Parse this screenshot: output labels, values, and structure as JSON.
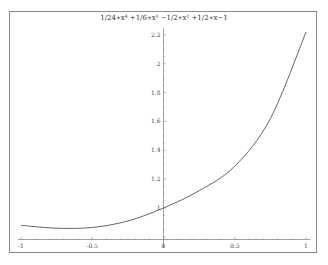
{
  "chart_data": {
    "type": "line",
    "title": "1/24∗x⁴ +1/6∗x³ −1/2∗x² +1/2∗x−1",
    "xlabel": "",
    "ylabel": "",
    "xlim": [
      -1,
      1
    ],
    "ylim": [
      0.78,
      2.25
    ],
    "grid": false,
    "legend": null,
    "x_ticks": [
      "-1",
      "-0.5",
      "0",
      "0.5",
      "1"
    ],
    "y_ticks": [
      "1",
      "1.2",
      "1.4",
      "1.6",
      "1.8",
      "2",
      "2.2"
    ],
    "series": [
      {
        "name": "f(x)",
        "x": [
          -1,
          -0.75,
          -0.5,
          -0.25,
          0,
          0.25,
          0.5,
          0.75,
          1
        ],
        "values": [
          0.88,
          0.86,
          0.865,
          0.91,
          1.0,
          1.12,
          1.29,
          1.62,
          2.22
        ]
      }
    ],
    "line_color": "#555555",
    "axis_color": "#888888"
  }
}
